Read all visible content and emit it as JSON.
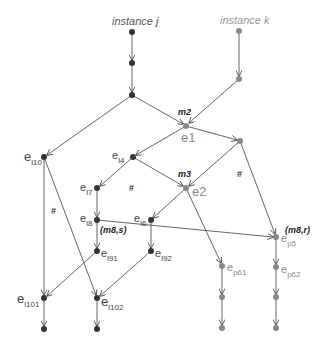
{
  "diagram": {
    "instances": [
      {
        "id": "j",
        "label": "instance j"
      },
      {
        "id": "k",
        "label": "instance k"
      }
    ],
    "messages": [
      {
        "label": "m2"
      },
      {
        "label": "m3"
      },
      {
        "label": "(m8,s)"
      },
      {
        "label": "(m8,r)"
      }
    ],
    "events": {
      "e1": {
        "base": "e",
        "sub": "",
        "text": "e1"
      },
      "e2": {
        "base": "e",
        "sub": "",
        "text": "e2"
      },
      "el10": {
        "base": "e",
        "sub": "l10"
      },
      "el4": {
        "base": "e",
        "sub": "l4"
      },
      "el7": {
        "base": "e",
        "sub": "l7"
      },
      "el8": {
        "base": "e",
        "sub": "l8"
      },
      "el6": {
        "base": "e",
        "sub": "l6"
      },
      "el91": {
        "base": "e",
        "sub": "l91"
      },
      "el92": {
        "base": "e",
        "sub": "l92"
      },
      "el101": {
        "base": "e",
        "sub": "l101"
      },
      "el102": {
        "base": "e",
        "sub": "l102"
      },
      "ep5": {
        "base": "e",
        "sub": "p5"
      },
      "ep61": {
        "base": "e",
        "sub": "p61"
      },
      "ep62": {
        "base": "e",
        "sub": "p62"
      }
    },
    "concurrency_marker": "#",
    "colors": {
      "dark_node": "#333333",
      "gray_node": "#888888",
      "edge": "#555555"
    }
  }
}
